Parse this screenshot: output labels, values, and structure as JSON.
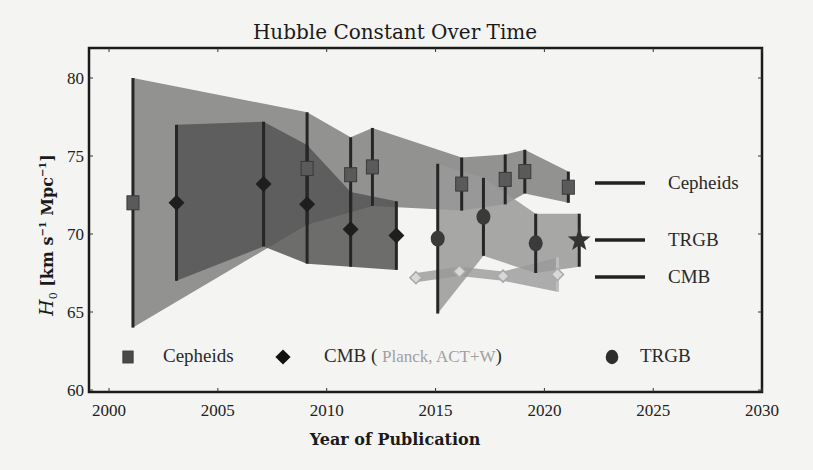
{
  "chart_data": {
    "type": "scatter",
    "title": "Hubble Constant Over Time",
    "xlabel": "Year of Publication",
    "ylabel": "H_0 [km s^-1 Mpc^-1]",
    "xlim": [
      1999.5,
      2030
    ],
    "ylim": [
      60,
      82
    ],
    "x_ticks": [
      2000,
      2005,
      2010,
      2015,
      2020,
      2025,
      2030
    ],
    "y_ticks": [
      60,
      65,
      70,
      75,
      80
    ],
    "grid": false,
    "series": [
      {
        "name": "Cepheids",
        "marker": "square",
        "color": "#5a5a5a",
        "points": [
          {
            "x": 2001.1,
            "y": 72.0,
            "err_low": 8.0,
            "err_high": 8.0
          },
          {
            "x": 2009.1,
            "y": 74.2,
            "err_low": 3.6,
            "err_high": 3.6
          },
          {
            "x": 2011.1,
            "y": 73.8,
            "err_low": 2.4,
            "err_high": 2.4
          },
          {
            "x": 2012.1,
            "y": 74.3,
            "err_low": 2.5,
            "err_high": 2.5
          },
          {
            "x": 2016.2,
            "y": 73.2,
            "err_low": 1.7,
            "err_high": 1.7
          },
          {
            "x": 2018.2,
            "y": 73.5,
            "err_low": 1.6,
            "err_high": 1.6
          },
          {
            "x": 2019.1,
            "y": 74.0,
            "err_low": 1.4,
            "err_high": 1.4
          },
          {
            "x": 2021.1,
            "y": 73.0,
            "err_low": 1.0,
            "err_high": 1.0
          }
        ]
      },
      {
        "name": "CMB",
        "marker": "diamond",
        "color": "#1e1e1e",
        "points": [
          {
            "x": 2003.1,
            "y": 72.0,
            "err_low": 5.0,
            "err_high": 5.0
          },
          {
            "x": 2007.1,
            "y": 73.2,
            "err_low": 4.0,
            "err_high": 4.0
          },
          {
            "x": 2009.1,
            "y": 71.9,
            "err_low": 3.8,
            "err_high": 3.8
          },
          {
            "x": 2011.1,
            "y": 70.3,
            "err_low": 2.4,
            "err_high": 2.4
          },
          {
            "x": 2013.2,
            "y": 69.9,
            "err_low": 2.2,
            "err_high": 2.2
          }
        ]
      },
      {
        "name": "CMB (Planck, ACT+W)",
        "marker": "open-diamond",
        "color": "#b5b5b5",
        "points": [
          {
            "x": 2014.1,
            "y": 67.2,
            "err_low": 0.3,
            "err_high": 0.3
          },
          {
            "x": 2016.1,
            "y": 67.6,
            "err_low": 0.3,
            "err_high": 0.3
          },
          {
            "x": 2018.1,
            "y": 67.3,
            "err_low": 0.3,
            "err_high": 0.3
          },
          {
            "x": 2020.6,
            "y": 67.4,
            "err_low": 1.1,
            "err_high": 1.1
          }
        ]
      },
      {
        "name": "TRGB",
        "marker": "circle",
        "color": "#3a3a3a",
        "points": [
          {
            "x": 2015.1,
            "y": 69.7,
            "err_low": 4.8,
            "err_high": 4.8
          },
          {
            "x": 2017.2,
            "y": 71.1,
            "err_low": 2.5,
            "err_high": 2.5
          },
          {
            "x": 2019.6,
            "y": 69.4,
            "err_low": 1.9,
            "err_high": 1.9
          },
          {
            "x": 2021.6,
            "y": 69.6,
            "err_low": 1.7,
            "err_high": 1.7,
            "marker": "star"
          }
        ]
      }
    ],
    "bands": [
      {
        "name": "Cepheids",
        "color": "#808080",
        "opacity": 0.85
      },
      {
        "name": "CMB",
        "color": "#555555",
        "opacity": 0.85
      },
      {
        "name": "CMB (Planck, ACT+W)",
        "color": "#9a9a9a",
        "opacity": 0.8
      },
      {
        "name": "TRGB",
        "color": "#999999",
        "opacity": 0.85
      }
    ],
    "legend": {
      "bottom": [
        {
          "marker": "square",
          "label": "Cepheids"
        },
        {
          "marker": "diamond",
          "label": "CMB (",
          "sub_label": "Planck, ACT+W",
          "close": ")"
        },
        {
          "marker": "circle",
          "label": "TRGB"
        }
      ],
      "right": [
        {
          "label": "Cepheids",
          "y": 73.0
        },
        {
          "label": "TRGB",
          "y": 69.6
        },
        {
          "label": "CMB",
          "y": 67.4
        }
      ]
    }
  }
}
